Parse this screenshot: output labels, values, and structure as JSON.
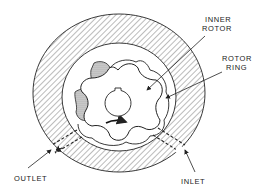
{
  "diagram": {
    "labels": {
      "inner_rotor_line1": "INNER",
      "inner_rotor_line2": "ROTOR",
      "rotor_ring_line1": "ROTOR",
      "rotor_ring_line2": "RING",
      "outlet": "OUTLET",
      "inlet": "INLET"
    },
    "colors": {
      "line": "#222222",
      "hatch": "#555555",
      "stipple": "#9a9a9a",
      "background": "#ffffff"
    }
  }
}
